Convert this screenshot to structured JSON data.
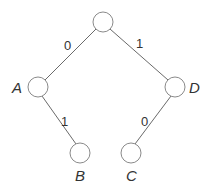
{
  "diagram": {
    "type": "binary-tree",
    "nodes": [
      {
        "id": "root",
        "label": "",
        "x": 103,
        "y": 22
      },
      {
        "id": "A",
        "label": "A",
        "x": 38,
        "y": 87
      },
      {
        "id": "D",
        "label": "D",
        "x": 175,
        "y": 87
      },
      {
        "id": "B",
        "label": "B",
        "x": 80,
        "y": 153
      },
      {
        "id": "C",
        "label": "C",
        "x": 131,
        "y": 153
      }
    ],
    "edges": [
      {
        "from": "root",
        "to": "A",
        "label": "0"
      },
      {
        "from": "root",
        "to": "D",
        "label": "1"
      },
      {
        "from": "A",
        "to": "B",
        "label": "1"
      },
      {
        "from": "D",
        "to": "C",
        "label": "0"
      }
    ],
    "node_labels": {
      "A": "A",
      "D": "D",
      "B": "B",
      "C": "C"
    },
    "edge_labels": {
      "root_A": "0",
      "root_D": "1",
      "A_B": "1",
      "D_C": "0"
    }
  }
}
